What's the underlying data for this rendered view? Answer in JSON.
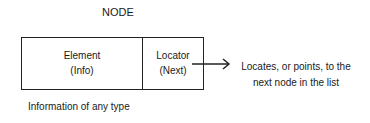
{
  "diagram": {
    "title": "NODE",
    "node": {
      "element": {
        "label": "Element",
        "sublabel": "(Info)"
      },
      "locator": {
        "label": "Locator",
        "sublabel": "(Next)"
      }
    },
    "caption": "Information of any type",
    "arrow_description": {
      "line1": "Locates, or points, to the",
      "line2": "next node in the list"
    },
    "colors": {
      "stroke": "#222222",
      "text": "#1a1a1a",
      "background": "#ffffff"
    }
  }
}
